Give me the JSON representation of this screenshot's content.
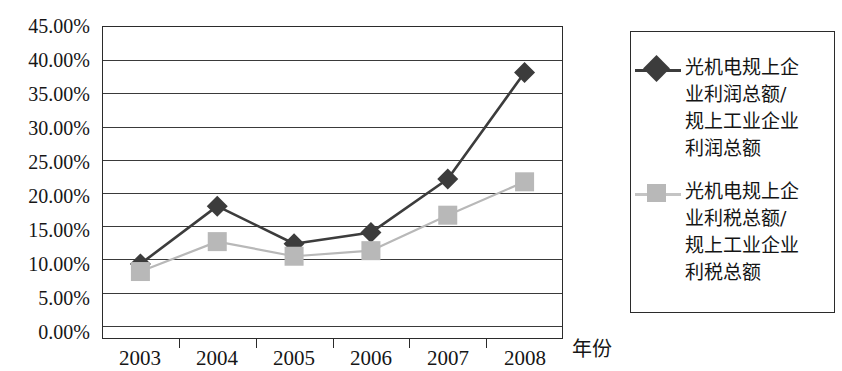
{
  "chart_data": {
    "type": "line",
    "title": "",
    "xlabel": "年份",
    "ylabel": "",
    "categories": [
      "2003",
      "2004",
      "2005",
      "2006",
      "2007",
      "2008"
    ],
    "ylim": [
      0,
      45
    ],
    "ytick_step": 5,
    "ytick_labels": [
      "0.00%",
      "5.00%",
      "10.00%",
      "15.00%",
      "20.00%",
      "25.00%",
      "30.00%",
      "35.00%",
      "40.00%",
      "45.00%"
    ],
    "ytick_values": [
      0,
      5,
      10,
      15,
      20,
      25,
      30,
      35,
      40,
      45
    ],
    "grid": true,
    "legend_position": "right",
    "series": [
      {
        "name": "光机电规上企业利润总额/规上工业企业利润总额",
        "marker": "diamond",
        "color": "#3c3c3c",
        "values": [
          10.8,
          19.1,
          13.7,
          15.3,
          23.0,
          38.3
        ]
      },
      {
        "name": "光机电规上企业利税总额/规上工业企业利税总额",
        "marker": "square",
        "color": "#b8b8b8",
        "values": [
          9.7,
          14.0,
          11.9,
          12.7,
          17.8,
          22.6
        ]
      }
    ]
  },
  "axes": {
    "y_labels": [
      "45.00%",
      "40.00%",
      "35.00%",
      "30.00%",
      "25.00%",
      "20.00%",
      "15.00%",
      "10.00%",
      "5.00%",
      "0.00%"
    ],
    "x_labels": [
      "2003",
      "2004",
      "2005",
      "2006",
      "2007",
      "2008"
    ],
    "x_title": "年份"
  },
  "legend": {
    "entries": [
      {
        "marker": "diamond-marker",
        "label": "光机电规上企\n业利润总额/\n规上工业企业\n利润总额",
        "color": "#3c3c3c"
      },
      {
        "marker": "square-marker",
        "label": "光机电规上企\n业利税总额/\n规上工业企业\n利税总额",
        "color": "#b8b8b8"
      }
    ]
  },
  "colors": {
    "series_1": "#3c3c3c",
    "series_2": "#b8b8b8",
    "axis": "#2b2b2b",
    "grid": "#3a3a3a",
    "background": "#ffffff"
  }
}
